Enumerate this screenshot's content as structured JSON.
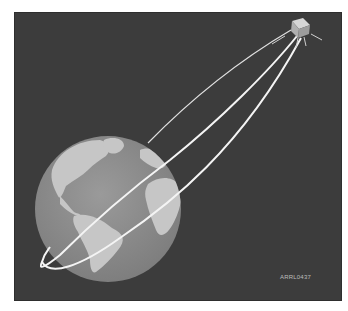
{
  "figure": {
    "label": "ARRL0437",
    "colors": {
      "background": "#3c3c3c",
      "earth_ocean": "#8a8a8a",
      "earth_land": "#c4c4c4",
      "orbit": "#f2f2f2",
      "satellite": "#b5b5b5",
      "label": "#bdbdbd"
    },
    "elements": {
      "earth": "earth-globe-americas-africa",
      "satellite": "satellite-cube-with-antennas",
      "orbit": "elliptical-orbit"
    }
  }
}
